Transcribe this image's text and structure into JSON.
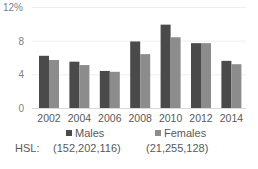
{
  "chart_data": {
    "type": "bar",
    "title": "",
    "xlabel": "",
    "ylabel": "",
    "categories": [
      "2002",
      "2004",
      "2006",
      "2008",
      "2010",
      "2012",
      "2014"
    ],
    "series": [
      {
        "name": "Males",
        "color": "#4a4a4a",
        "values": [
          6.2,
          5.5,
          4.4,
          7.9,
          9.9,
          7.7,
          5.6
        ]
      },
      {
        "name": "Females",
        "color": "#8c8c8c",
        "values": [
          5.7,
          5.1,
          4.3,
          6.4,
          8.4,
          7.7,
          5.2
        ]
      }
    ],
    "ylim": [
      0,
      12
    ],
    "yticks": [
      "0",
      "4",
      "8",
      "12%"
    ],
    "grid": true,
    "legend_position": "bottom"
  },
  "legend": {
    "males_label": "Males",
    "males_hsl": "(152,202,116)",
    "females_label": "Females",
    "females_hsl": "(21,255,128)",
    "hsl_prefix": "HSL:"
  }
}
